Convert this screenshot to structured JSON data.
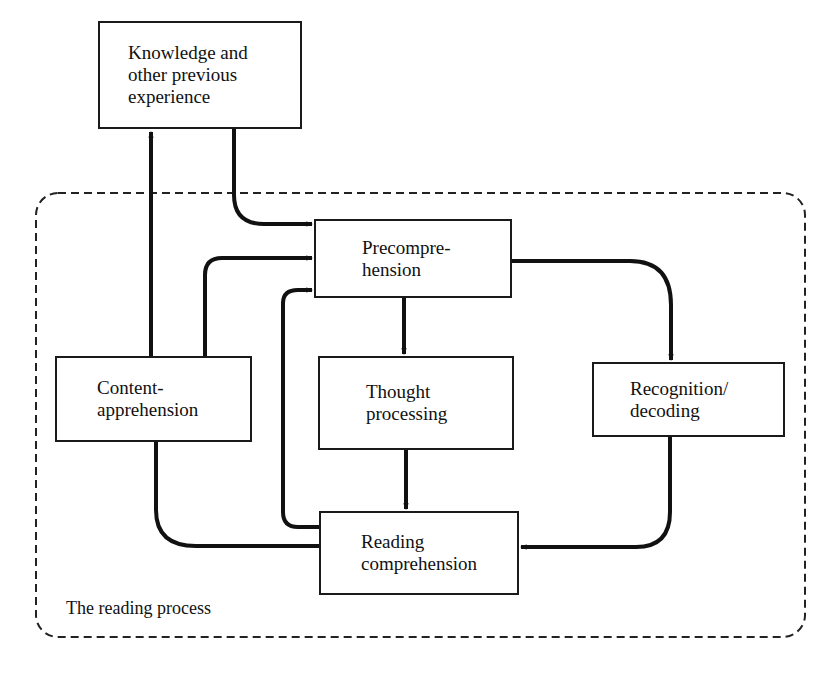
{
  "diagram": {
    "type": "flowchart",
    "container_label": "The reading process",
    "nodes": {
      "knowledge": "Knowledge and\nother previous\nexperience",
      "precomprehension": "Precompre-\nhension",
      "content": "Content-\napprehension",
      "thought": "Thought\nprocessing",
      "recognition": "Recognition/\ndecoding",
      "reading": "Reading\ncomprehension"
    },
    "edges": [
      {
        "from": "knowledge",
        "to": "precomprehension"
      },
      {
        "from": "content",
        "to": "knowledge"
      },
      {
        "from": "content",
        "to": "precomprehension"
      },
      {
        "from": "reading",
        "to": "precomprehension"
      },
      {
        "from": "precomprehension",
        "to": "thought"
      },
      {
        "from": "precomprehension",
        "to": "recognition"
      },
      {
        "from": "thought",
        "to": "reading"
      },
      {
        "from": "recognition",
        "to": "reading"
      },
      {
        "from": "content",
        "to": "reading"
      }
    ],
    "colors": {
      "line": "#111111",
      "background": "#ffffff"
    }
  }
}
